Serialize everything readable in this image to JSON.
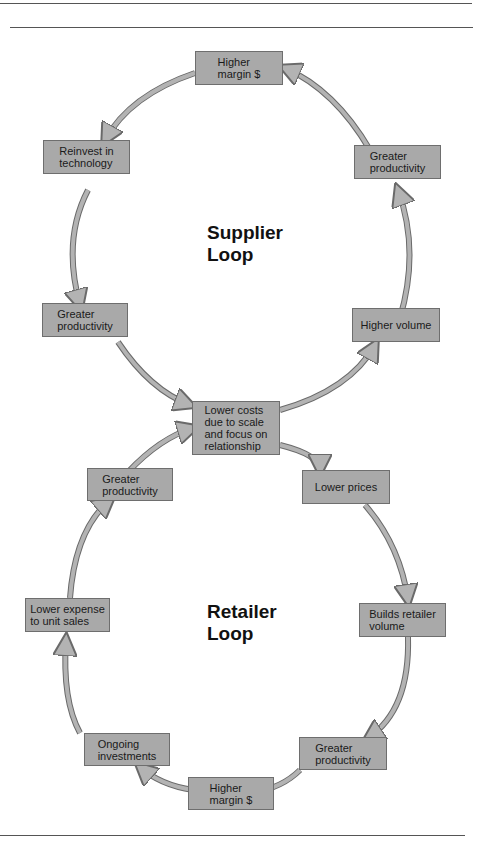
{
  "colors": {
    "node_fill": "#a9a9a9",
    "node_border": "#6e6e6e",
    "arrow_fill": "#b3b3b3",
    "arrow_stroke": "#6a6a6a",
    "rule": "#555555"
  },
  "supplier_loop": {
    "title": "Supplier\nLoop",
    "nodes": {
      "top": "Higher\nmargin $",
      "reinvest": "Reinvest in\ntechnology",
      "prod_right": "Greater\nproductivity",
      "prod_left": "Greater\nproductivity",
      "volume": "Higher volume"
    }
  },
  "center_node": "Lower costs\ndue to scale\nand focus on\nrelationship",
  "retailer_loop": {
    "title": "Retailer\nLoop",
    "nodes": {
      "prod_left": "Greater\nproductivity",
      "prices": "Lower prices",
      "expense": "Lower expense\nto unit sales",
      "builds": "Builds  retailer\nvolume",
      "ongoing": "Ongoing\ninvestments",
      "prod_right": "Greater\nproductivity",
      "margin": "Higher\nmargin $"
    }
  }
}
